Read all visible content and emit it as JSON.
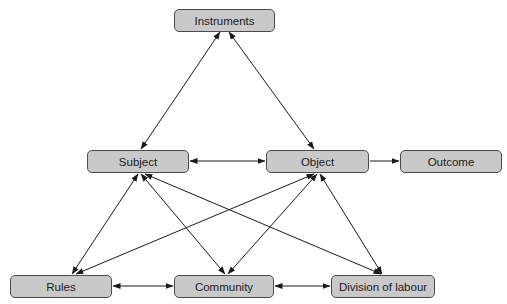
{
  "diagram": {
    "title": "",
    "colors": {
      "node_fill": "#c9c9c9",
      "node_border": "#4a4a4a",
      "edge": "#1a1a1a",
      "text": "#1a1a1a",
      "background": "#ffffff"
    },
    "nodes": {
      "instruments": {
        "label": "Instruments",
        "x": 174,
        "y": 9,
        "w": 101,
        "h": 23
      },
      "subject": {
        "label": "Subject",
        "x": 87,
        "y": 150,
        "w": 102,
        "h": 23
      },
      "object": {
        "label": "Object",
        "x": 266,
        "y": 150,
        "w": 103,
        "h": 23
      },
      "outcome": {
        "label": "Outcome",
        "x": 400,
        "y": 150,
        "w": 102,
        "h": 23
      },
      "rules": {
        "label": "Rules",
        "x": 10,
        "y": 275,
        "w": 102,
        "h": 23
      },
      "community": {
        "label": "Community",
        "x": 174,
        "y": 275,
        "w": 100,
        "h": 23
      },
      "division": {
        "label": "Division of labour",
        "x": 331,
        "y": 275,
        "w": 104,
        "h": 23
      }
    },
    "edges": [
      {
        "from": "instruments",
        "to": "subject",
        "type": "bidirectional",
        "x1": 220,
        "y1": 32,
        "x2": 141,
        "y2": 149
      },
      {
        "from": "instruments",
        "to": "object",
        "type": "bidirectional",
        "x1": 229,
        "y1": 32,
        "x2": 314,
        "y2": 149
      },
      {
        "from": "subject",
        "to": "object",
        "type": "bidirectional",
        "x1": 190,
        "y1": 161,
        "x2": 265,
        "y2": 161
      },
      {
        "from": "object",
        "to": "outcome",
        "type": "directed",
        "x1": 370,
        "y1": 161,
        "x2": 399,
        "y2": 161
      },
      {
        "from": "subject",
        "to": "rules",
        "type": "bidirectional",
        "x1": 138,
        "y1": 174,
        "x2": 72,
        "y2": 274
      },
      {
        "from": "subject",
        "to": "community",
        "type": "bidirectional",
        "x1": 141,
        "y1": 174,
        "x2": 225,
        "y2": 274
      },
      {
        "from": "subject",
        "to": "division",
        "type": "bidirectional",
        "x1": 145,
        "y1": 174,
        "x2": 381,
        "y2": 274
      },
      {
        "from": "object",
        "to": "rules",
        "type": "bidirectional",
        "x1": 314,
        "y1": 174,
        "x2": 76,
        "y2": 274
      },
      {
        "from": "object",
        "to": "community",
        "type": "bidirectional",
        "x1": 317,
        "y1": 174,
        "x2": 228,
        "y2": 274
      },
      {
        "from": "object",
        "to": "division",
        "type": "bidirectional",
        "x1": 320,
        "y1": 174,
        "x2": 382,
        "y2": 274
      },
      {
        "from": "rules",
        "to": "community",
        "type": "bidirectional",
        "x1": 113,
        "y1": 286,
        "x2": 173,
        "y2": 286
      },
      {
        "from": "community",
        "to": "division",
        "type": "bidirectional",
        "x1": 275,
        "y1": 286,
        "x2": 330,
        "y2": 286
      }
    ]
  }
}
